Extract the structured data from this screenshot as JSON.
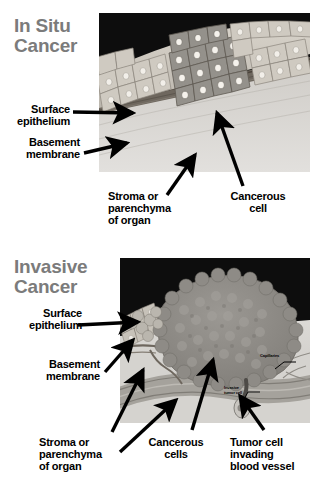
{
  "figure": {
    "background_color": "#ffffff",
    "title_color": "#7b7b7b",
    "label_color": "#000000",
    "arrow_color": "#000000"
  },
  "panels": [
    {
      "id": "in-situ",
      "title": "In Situ\nCancer",
      "illustration": {
        "name": "in-situ-cancer-histology",
        "description": "Cross section of epithelium showing darker cancerous cells confined above an intact basement membrane over stroma",
        "colors": {
          "background_void": "#0d0d0d",
          "normal_epithelium": "#c9c4bb",
          "cancer_cells": "#8a8884",
          "basement_membrane": "#6b645c",
          "stroma": "#d8d6d2"
        }
      },
      "labels": [
        {
          "name": "surface-epithelium",
          "text": "Surface\nepithelium",
          "align": "right"
        },
        {
          "name": "basement-membrane",
          "text": "Basement\nmembrane",
          "align": "right"
        },
        {
          "name": "stroma-parenchyma",
          "text": "Stroma or\nparenchyma\nof organ",
          "align": "left"
        },
        {
          "name": "cancerous-cell",
          "text": "Cancerous\ncell",
          "align": "center"
        }
      ]
    },
    {
      "id": "invasive",
      "title": "Invasive\nCancer",
      "illustration": {
        "name": "invasive-cancer-histology",
        "description": "Large tumor mass breaking through the basement membrane into stroma, with a tumor cell entering a blood vessel and capillaries at right",
        "colors": {
          "background_void": "#0d0d0d",
          "normal_epithelium": "#bdb8b0",
          "tumor_mass": "#8d8b87",
          "basement_membrane": "#6b645c",
          "stroma": "#d5d3cf",
          "blood_vessel": "#9a9892"
        },
        "inner_labels": [
          {
            "name": "capillaries",
            "text": "Capillaries"
          },
          {
            "name": "invasive-tumor-cell",
            "text": "Invasive\ntumor cell"
          }
        ]
      },
      "labels": [
        {
          "name": "surface-epithelium",
          "text": "Surface\nepithelium",
          "align": "right"
        },
        {
          "name": "basement-membrane",
          "text": "Basement\nmembrane",
          "align": "right"
        },
        {
          "name": "stroma-parenchyma",
          "text": "Stroma or\nparenchyma\nof organ",
          "align": "left"
        },
        {
          "name": "cancerous-cells",
          "text": "Cancerous\ncells",
          "align": "center"
        },
        {
          "name": "tumor-cell-invading",
          "text": "Tumor cell\ninvading\nblood vessel",
          "align": "left"
        }
      ]
    }
  ]
}
